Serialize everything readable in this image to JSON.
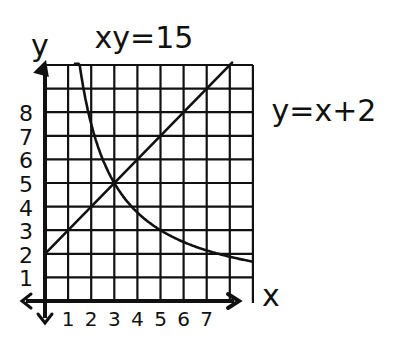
{
  "chart_data": {
    "type": "line",
    "title": "xy=15",
    "xlabel": "x",
    "ylabel": "y",
    "xlim": [
      0,
      9
    ],
    "ylim": [
      0,
      10
    ],
    "grid": true,
    "x_ticks": [
      "1",
      "2",
      "3",
      "4",
      "5",
      "6",
      "7"
    ],
    "y_ticks": [
      "1",
      "2",
      "3",
      "4",
      "5",
      "6",
      "7",
      "8"
    ],
    "annotations": [
      {
        "text": "xy=15",
        "position": "top-center"
      },
      {
        "text": "y=x+2",
        "position": "right"
      }
    ],
    "series": [
      {
        "name": "xy=15",
        "x": [
          1.5,
          2,
          2.5,
          3,
          4,
          5,
          6,
          7,
          8,
          9
        ],
        "y": [
          10,
          7.5,
          6,
          5,
          3.75,
          3,
          2.5,
          2.14,
          1.88,
          1.67
        ]
      },
      {
        "name": "y=x+2",
        "x": [
          0,
          1,
          2,
          3,
          4,
          5,
          6,
          7,
          8
        ],
        "y": [
          2,
          3,
          4,
          5,
          6,
          7,
          8,
          9,
          10
        ]
      }
    ],
    "intersection": {
      "x": 3,
      "y": 5
    }
  },
  "labels": {
    "title": "xy=15",
    "line_label": "y=x+2",
    "x_axis": "x",
    "y_axis": "y"
  }
}
